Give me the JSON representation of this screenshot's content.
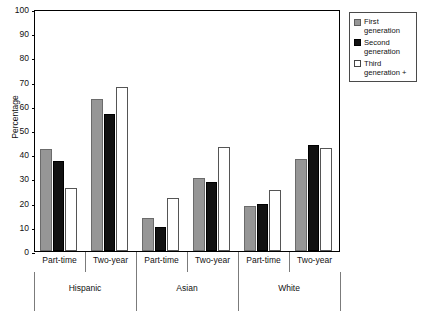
{
  "chart_data": {
    "type": "bar",
    "title": "",
    "xlabel": "",
    "ylabel": "Percentage",
    "ylim": [
      0,
      100
    ],
    "yticks": [
      0,
      10,
      20,
      30,
      40,
      50,
      60,
      70,
      80,
      90,
      100
    ],
    "grid": false,
    "legend_position": "outside-top-right",
    "groups": [
      "Hispanic",
      "Asian",
      "White"
    ],
    "subcategories": [
      "Part-time",
      "Two-year"
    ],
    "categories": [
      "Hispanic / Part-time",
      "Hispanic / Two-year",
      "Asian / Part-time",
      "Asian / Two-year",
      "White / Part-time",
      "White / Two-year"
    ],
    "series": [
      {
        "name": "First generation",
        "color": "#969696",
        "values": [
          42,
          63,
          13.5,
          30,
          18.7,
          38
        ]
      },
      {
        "name": "Second generation",
        "color": "#111111",
        "values": [
          37,
          56.5,
          9.8,
          28.7,
          19.5,
          44
        ]
      },
      {
        "name": "Third generation +",
        "color": "#ffffff",
        "values": [
          26,
          67.8,
          22,
          43,
          25.2,
          42.5
        ]
      }
    ]
  },
  "legend": {
    "items": [
      {
        "label": "First generation",
        "swatch": "gray-swatch"
      },
      {
        "label": "Second generation",
        "swatch": "black-swatch"
      },
      {
        "label": "Third generation +",
        "swatch": "white-swatch"
      }
    ]
  },
  "axis": {
    "y_title": "Percentage",
    "y_tick_labels": [
      "100",
      "90",
      "80",
      "70",
      "60",
      "50",
      "40",
      "30",
      "20",
      "10",
      "0"
    ],
    "sub_labels": [
      "Part-time",
      "Two-year",
      "Part-time",
      "Two-year",
      "Part-time",
      "Two-year"
    ],
    "group_labels": [
      "Hispanic",
      "Asian",
      "White"
    ]
  },
  "colors": {
    "first_generation": "#969696",
    "second_generation": "#111111",
    "third_generation": "#ffffff",
    "axis": "#000000",
    "separator": "#7b7b7b",
    "background": "#ffffff"
  }
}
